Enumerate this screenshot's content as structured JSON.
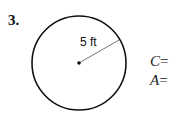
{
  "problem": {
    "number": "3.",
    "radius_label": "5 ft",
    "circumference": {
      "var": "C",
      "op": "="
    },
    "area": {
      "var": "A",
      "op": "="
    }
  }
}
